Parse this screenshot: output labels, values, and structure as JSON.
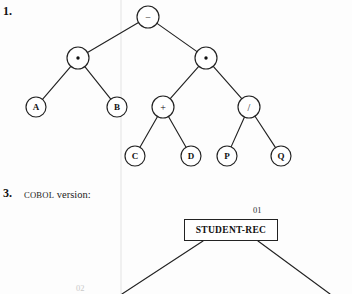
{
  "page": {
    "background": "#fdfdfd",
    "ink_color": "#222222"
  },
  "exercises": [
    {
      "number": "1.",
      "type": "expression-tree",
      "caption": ""
    },
    {
      "number": "3.",
      "type": "cobol-record-diagram",
      "caption_smallcaps": "COBOL",
      "caption_rest": " version:"
    }
  ],
  "expression_tree": {
    "expression": "(A * B) - ((C + D) * (P / Q))",
    "nodes": [
      {
        "id": "root",
        "label": "−",
        "kind": "operator",
        "glyph": "minus",
        "cx": 148,
        "cy": 17,
        "r": 11
      },
      {
        "id": "mulL",
        "label": "·",
        "kind": "operator",
        "glyph": "dot",
        "cx": 78,
        "cy": 58,
        "r": 11
      },
      {
        "id": "mulR",
        "label": "·",
        "kind": "operator",
        "glyph": "dot",
        "cx": 206,
        "cy": 58,
        "r": 11
      },
      {
        "id": "A",
        "label": "A",
        "kind": "leaf",
        "glyph": "text",
        "cx": 36,
        "cy": 107,
        "r": 10
      },
      {
        "id": "B",
        "label": "B",
        "kind": "leaf",
        "glyph": "text",
        "cx": 117,
        "cy": 107,
        "r": 10
      },
      {
        "id": "plus",
        "label": "+",
        "kind": "operator",
        "glyph": "text",
        "cx": 163,
        "cy": 107,
        "r": 11
      },
      {
        "id": "div",
        "label": "/",
        "kind": "operator",
        "glyph": "text",
        "cx": 249,
        "cy": 107,
        "r": 11
      },
      {
        "id": "C",
        "label": "C",
        "kind": "leaf",
        "glyph": "text",
        "cx": 135,
        "cy": 156,
        "r": 10
      },
      {
        "id": "D",
        "label": "D",
        "kind": "leaf",
        "glyph": "text",
        "cx": 191,
        "cy": 156,
        "r": 10
      },
      {
        "id": "P",
        "label": "P",
        "kind": "leaf",
        "glyph": "text",
        "cx": 227,
        "cy": 156,
        "r": 10
      },
      {
        "id": "Q",
        "label": "Q",
        "kind": "leaf",
        "glyph": "text",
        "cx": 281,
        "cy": 156,
        "r": 10
      }
    ],
    "edges": [
      {
        "from": "root",
        "to": "mulL"
      },
      {
        "from": "root",
        "to": "mulR"
      },
      {
        "from": "mulL",
        "to": "A"
      },
      {
        "from": "mulL",
        "to": "B"
      },
      {
        "from": "mulR",
        "to": "plus"
      },
      {
        "from": "mulR",
        "to": "div"
      },
      {
        "from": "plus",
        "to": "C"
      },
      {
        "from": "plus",
        "to": "D"
      },
      {
        "from": "div",
        "to": "P"
      },
      {
        "from": "div",
        "to": "Q"
      }
    ]
  },
  "cobol_diagram": {
    "root_box": {
      "label": "STUDENT-REC",
      "level": "01",
      "x": 184,
      "y": 219,
      "width": 94,
      "height": 22
    },
    "child_level": "02",
    "branches": [
      {
        "from_x": 203,
        "from_y": 241,
        "to_x": 122,
        "to_y": 294
      },
      {
        "from_x": 258,
        "from_y": 241,
        "to_x": 330,
        "to_y": 294
      }
    ]
  }
}
